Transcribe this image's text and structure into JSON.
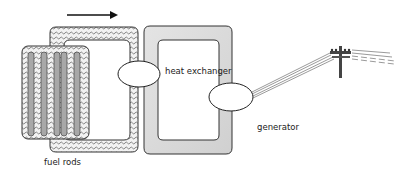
{
  "diagram": {
    "labels": {
      "fuel_rods": "fuel rods",
      "heat_exchanger": "heat exchanger",
      "generator": "generator"
    },
    "flow_direction": "right",
    "colors": {
      "outline": "#333333",
      "primary_loop_fill": "#e6e6e6",
      "secondary_loop_fill": "#dcdcdc",
      "fuel_rod_fill": "#a8a8a8",
      "background": "#ffffff"
    }
  }
}
